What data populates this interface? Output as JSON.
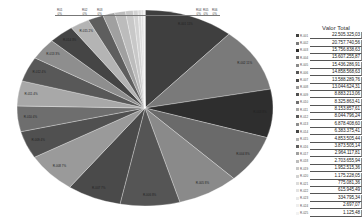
{
  "chart_data": {
    "type": "pie",
    "title": "",
    "legend_title": "Valor Total",
    "legend_position": "right",
    "start_angle_deg": 0,
    "direction": "clockwise",
    "center": [
      145,
      108
    ],
    "radii": [
      128,
      98
    ],
    "slices": [
      {
        "label": "R-001",
        "value": 22505325.03,
        "color": "#3f3f3f"
      },
      {
        "label": "R-002",
        "value": 20757740.56,
        "color": "#7a7a7a"
      },
      {
        "label": "R-003",
        "value": 15756838.63,
        "color": "#2e2e2e"
      },
      {
        "label": "R-004",
        "value": 15607255.87,
        "color": "#6a6a6a"
      },
      {
        "label": "R-005",
        "value": 15436286.91,
        "color": "#8a8a8a"
      },
      {
        "label": "R-006",
        "value": 14858568.63,
        "color": "#555555"
      },
      {
        "label": "R-007",
        "value": 13588289.76,
        "color": "#4a4a4a"
      },
      {
        "label": "R-008",
        "value": 13044624.31,
        "color": "#9a9a9a"
      },
      {
        "label": "R-009",
        "value": 8883213.06,
        "color": "#505050"
      },
      {
        "label": "R-010",
        "value": 8325863.41,
        "color": "#6e6e6e"
      },
      {
        "label": "R-011",
        "value": 8153857.61,
        "color": "#a8a8a8"
      },
      {
        "label": "R-012",
        "value": 8044796.24,
        "color": "#585858"
      },
      {
        "label": "R-013",
        "value": 6878408.6,
        "color": "#8e8e8e"
      },
      {
        "label": "R-014",
        "value": 6383375.41,
        "color": "#454545"
      },
      {
        "label": "R-015",
        "value": 4853505.44,
        "color": "#b4b4b4"
      },
      {
        "label": "R-016",
        "value": 3873505.14,
        "color": "#5e5e5e"
      },
      {
        "label": "R-017",
        "value": 2964117.81,
        "color": "#a0a0a0"
      },
      {
        "label": "R-018",
        "value": 2703655.94,
        "color": "#bcbcbc"
      },
      {
        "label": "R-019",
        "value": 1952515.36,
        "color": "#c8c8c8"
      },
      {
        "label": "R-020",
        "value": 1175228.05,
        "color": "#d2d2d2"
      },
      {
        "label": "R-021",
        "value": 775081.36,
        "color": "#dcdcdc"
      },
      {
        "label": "R-022",
        "value": 615945.49,
        "color": "#e2e2e2"
      },
      {
        "label": "R-023",
        "value": 334795.34,
        "color": "#e8e8e8"
      },
      {
        "label": "R-024",
        "value": 2697.07,
        "color": "#eeeeee"
      },
      {
        "label": "R-025",
        "value": 1125.48,
        "color": "#f2f2f2"
      }
    ],
    "legend_values": [
      "22.505.325,03",
      "20.757.740,56",
      "15.756.838,63",
      "15.607.255,87",
      "15.436.286,91",
      "14.858.568,63",
      "13.588.289,76",
      "13.044.624,31",
      "8.883.213,06",
      "8.325.863,41",
      "8.153.857,61",
      "8.044.796,24",
      "6.878.408,60",
      "6.383.375,41",
      "4.853.505,44",
      "3.873.505,14",
      "2.964.117,81",
      "2.703.655,94",
      "1.952.515,36",
      "1.175.228,05",
      "775.081,36",
      "615.945,49",
      "334.795,34",
      "2.697,07",
      "1.125,48"
    ],
    "top_labels": [
      {
        "text": "R01\n0%",
        "x": 57
      },
      {
        "text": "R02\n0%",
        "x": 82
      },
      {
        "text": "R03\n0%",
        "x": 97
      },
      {
        "text": "R04\n0%",
        "x": 196
      },
      {
        "text": "R05\n0%",
        "x": 203
      },
      {
        "text": "R06\n0%",
        "x": 212
      }
    ]
  }
}
